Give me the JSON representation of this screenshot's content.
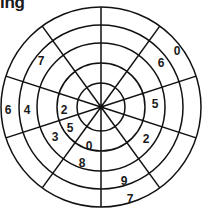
{
  "title": "ing",
  "wheel": {
    "center": [
      101,
      107
    ],
    "radii": [
      24,
      44,
      64,
      82,
      100
    ],
    "spoke_angles_deg": [
      18,
      54,
      90,
      126,
      162,
      198,
      234,
      270,
      306,
      342
    ],
    "stroke_color": "#111111"
  },
  "numbers": [
    {
      "value": "0",
      "x": 177,
      "y": 51
    },
    {
      "value": "6",
      "x": 161,
      "y": 63
    },
    {
      "value": "5",
      "x": 155,
      "y": 104
    },
    {
      "value": "2",
      "x": 146,
      "y": 139
    },
    {
      "value": "9",
      "x": 124,
      "y": 181
    },
    {
      "value": "7",
      "x": 130,
      "y": 199
    },
    {
      "value": "8",
      "x": 82,
      "y": 163
    },
    {
      "value": "0",
      "x": 89,
      "y": 146
    },
    {
      "value": "5",
      "x": 70,
      "y": 128
    },
    {
      "value": "3",
      "x": 55,
      "y": 137
    },
    {
      "value": "2",
      "x": 64,
      "y": 110
    },
    {
      "value": "4",
      "x": 27,
      "y": 110
    },
    {
      "value": "6",
      "x": 8,
      "y": 110
    },
    {
      "value": "7",
      "x": 41,
      "y": 61
    }
  ]
}
